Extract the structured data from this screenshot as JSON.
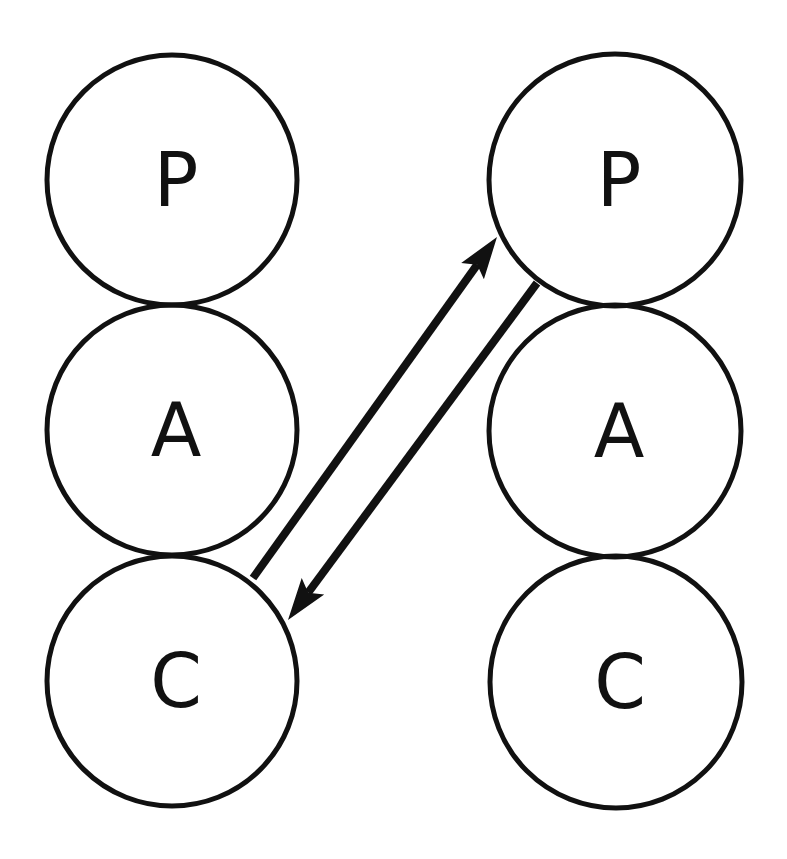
{
  "diagram": {
    "type": "transactional-analysis",
    "colors": {
      "stroke": "#111111",
      "background": "#ffffff"
    },
    "left_person": {
      "states": [
        {
          "label": "P",
          "cx": 172,
          "cy": 180,
          "r": 125
        },
        {
          "label": "A",
          "cx": 172,
          "cy": 430,
          "r": 125
        },
        {
          "label": "C",
          "cx": 172,
          "cy": 681,
          "r": 125
        }
      ]
    },
    "right_person": {
      "states": [
        {
          "label": "P",
          "cx": 615,
          "cy": 180,
          "r": 126
        },
        {
          "label": "A",
          "cx": 615,
          "cy": 431,
          "r": 126
        },
        {
          "label": "C",
          "cx": 616,
          "cy": 682,
          "r": 126
        }
      ]
    },
    "transactions": [
      {
        "from": "left.C",
        "to": "right.P",
        "direction": "up-right",
        "x1": 253,
        "y1": 578,
        "x2": 497,
        "y2": 237
      },
      {
        "from": "right.P",
        "to": "left.C",
        "direction": "down-left",
        "x1": 537,
        "y1": 283,
        "x2": 288,
        "y2": 620
      }
    ]
  }
}
